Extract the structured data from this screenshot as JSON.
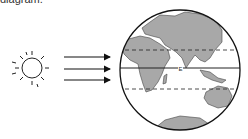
{
  "caption": "diagram.",
  "diagram": {
    "sun": {
      "label": "sun-icon"
    },
    "rays": {
      "count": 3,
      "direction": "right"
    },
    "globe": {
      "equator_label": "E",
      "lines": [
        "tropic-north-dashed",
        "equator-solid",
        "tropic-south-dashed"
      ],
      "land_color": "#a8a8a8",
      "outline_color": "#111111"
    }
  }
}
